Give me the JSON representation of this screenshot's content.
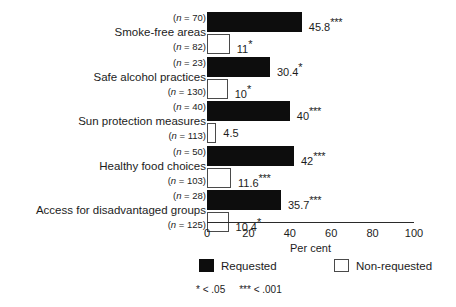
{
  "chart_data": {
    "type": "bar",
    "orientation": "horizontal",
    "title": "",
    "xlabel": "Per cent",
    "ylabel": "",
    "xlim": [
      0,
      100
    ],
    "xticks": [
      "0",
      "20",
      "40",
      "60",
      "80",
      "100"
    ],
    "grid": false,
    "legend_position": "bottom",
    "categories": [
      "Smoke-free areas",
      "Safe alcohol practices",
      "Sun protection measures",
      "Healthy food choices",
      "Access for disadvantaged groups"
    ],
    "series": [
      {
        "name": "Requested",
        "color": "#0d0d0d",
        "values": [
          45.8,
          30.4,
          40,
          42,
          35.7
        ],
        "value_labels": [
          "45.8",
          "30.4",
          "40",
          "42",
          "35.7"
        ],
        "significance": [
          "***",
          "*",
          "***",
          "***",
          "***"
        ],
        "n_labels": [
          "(n = 70)",
          "(n = 23)",
          "(n = 40)",
          "(n = 50)",
          "(n = 28)"
        ],
        "n_values": [
          70,
          23,
          40,
          50,
          28
        ]
      },
      {
        "name": "Non-requested",
        "color": "#ffffff",
        "values": [
          11,
          10,
          4.5,
          11.6,
          10.4
        ],
        "value_labels": [
          "11",
          "10",
          "4.5",
          "11.6",
          "10.4"
        ],
        "significance": [
          "*",
          "*",
          "",
          "***",
          "*"
        ],
        "n_labels": [
          "(n = 82)",
          "(n = 130)",
          "(n = 113)",
          "(n = 103)",
          "(n = 125)"
        ],
        "n_values": [
          82,
          130,
          113,
          103,
          125
        ]
      }
    ],
    "legend": [
      "Requested",
      "Non-requested"
    ],
    "footnote": {
      "p05": "*  < .05",
      "p001": "***  < .001"
    }
  },
  "groups": [
    {
      "category": "Smoke-free areas",
      "requested": {
        "n": "(n = 70)",
        "value": 45.8,
        "label": "45.8",
        "stars": "***"
      },
      "nonrequested": {
        "n": "(n = 82)",
        "value": 11,
        "label": "11",
        "stars": "*"
      }
    },
    {
      "category": "Safe alcohol practices",
      "requested": {
        "n": "(n = 23)",
        "value": 30.4,
        "label": "30.4",
        "stars": "*"
      },
      "nonrequested": {
        "n": "(n = 130)",
        "value": 10,
        "label": "10",
        "stars": "*"
      }
    },
    {
      "category": "Sun protection measures",
      "requested": {
        "n": "(n = 40)",
        "value": 40,
        "label": "40",
        "stars": "***"
      },
      "nonrequested": {
        "n": "(n = 113)",
        "value": 4.5,
        "label": "4.5",
        "stars": ""
      }
    },
    {
      "category": "Healthy food choices",
      "requested": {
        "n": "(n = 50)",
        "value": 42,
        "label": "42",
        "stars": "***"
      },
      "nonrequested": {
        "n": "(n = 103)",
        "value": 11.6,
        "label": "11.6",
        "stars": "***"
      }
    },
    {
      "category": "Access for disadvantaged groups",
      "requested": {
        "n": "(n = 28)",
        "value": 35.7,
        "label": "35.7",
        "stars": "***"
      },
      "nonrequested": {
        "n": "(n = 125)",
        "value": 10.4,
        "label": "10.4",
        "stars": "*"
      }
    }
  ],
  "axis": {
    "ticks": [
      "0",
      "20",
      "40",
      "60",
      "80",
      "100"
    ],
    "title": "Per cent"
  },
  "legend": {
    "requested": "Requested",
    "nonrequested": "Non-requested"
  },
  "footnote": {
    "p05": "*  < .05",
    "p001": "***  < .001"
  }
}
